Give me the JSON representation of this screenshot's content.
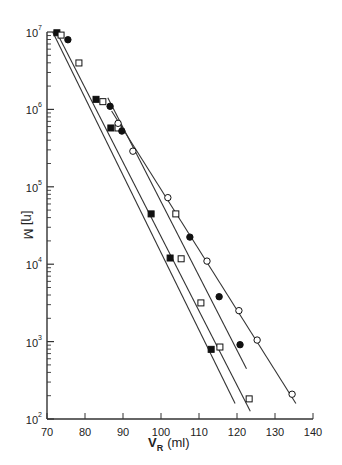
{
  "chart_data": {
    "type": "scatter",
    "title": "",
    "xlabel": "V_R (ml)",
    "xlabel_main": "V",
    "xlabel_sub": "R",
    "xlabel_unit": "(ml)",
    "ylabel": "[η] M",
    "xlim": [
      70,
      140
    ],
    "ylim": [
      100,
      10000000
    ],
    "yscale": "log",
    "grid": false,
    "legend": null,
    "x_ticks": [
      70,
      80,
      90,
      100,
      110,
      120,
      130,
      140
    ],
    "y_ticks": [
      {
        "base": "10",
        "exp": "2",
        "value": 100
      },
      {
        "base": "10",
        "exp": "3",
        "value": 1000
      },
      {
        "base": "10",
        "exp": "4",
        "value": 10000
      },
      {
        "base": "10",
        "exp": "5",
        "value": 100000
      },
      {
        "base": "10",
        "exp": "6",
        "value": 1000000
      },
      {
        "base": "10",
        "exp": "7",
        "value": 10000000
      }
    ],
    "series": [
      {
        "name": "filled squares",
        "marker": "square-filled",
        "x": [
          72.6,
          82.9,
          86.8,
          97.4,
          102.4,
          113.2
        ],
        "log10_y": [
          6.99,
          6.13,
          5.76,
          4.65,
          4.08,
          2.9
        ],
        "fit_line": {
          "x": [
            71.5,
            119.5
          ],
          "log10_y": [
            7.0,
            2.2
          ]
        }
      },
      {
        "name": "open squares",
        "marker": "square-open",
        "x": [
          73.7,
          78.4,
          84.7,
          88.7,
          103.9,
          105.3,
          110.5,
          115.5,
          123.2
        ],
        "log10_y": [
          6.96,
          6.6,
          6.1,
          5.76,
          4.65,
          4.07,
          3.5,
          2.93,
          2.26
        ],
        "fit_line": {
          "x": [
            72.5,
            123.5
          ],
          "log10_y": [
            7.0,
            2.1
          ]
        }
      },
      {
        "name": "filled circles",
        "marker": "circle-filled",
        "x": [
          75.5,
          86.6,
          89.7,
          107.6,
          115.3,
          120.8
        ],
        "log10_y": [
          6.9,
          6.04,
          5.72,
          4.35,
          3.58,
          2.96
        ],
        "fit_line": {
          "x": [
            86.0,
            122.5
          ],
          "log10_y": [
            6.15,
            2.65
          ]
        }
      },
      {
        "name": "open circles",
        "marker": "circle-open",
        "x": [
          88.7,
          92.6,
          101.8,
          112.1,
          120.5,
          125.3,
          134.5
        ],
        "log10_y": [
          5.82,
          5.46,
          4.86,
          4.04,
          3.4,
          3.02,
          2.32
        ],
        "fit_line": {
          "x": [
            87.0,
            135.5
          ],
          "log10_y": [
            5.98,
            2.2
          ]
        }
      }
    ]
  }
}
